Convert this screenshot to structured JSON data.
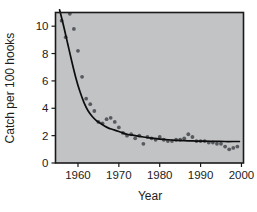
{
  "figure": {
    "background_color": "#ffffff",
    "plot_background_color": "#c2c3c5",
    "frame_color": "#1a1a1a",
    "point_color": "#565a5e",
    "curve_color": "#0d0d0d"
  },
  "axes": {
    "x_title": "Year",
    "y_title": "Catch per 100 hooks",
    "x_ticks": [
      "1960",
      "1970",
      "1980",
      "1990",
      "2000"
    ],
    "y_ticks": [
      "0",
      "2",
      "4",
      "6",
      "8",
      "10"
    ]
  },
  "chart_data": {
    "type": "scatter",
    "title": "",
    "xlabel": "Year",
    "ylabel": "Catch per 100 hooks",
    "xlim": [
      1954.5,
      2000.5
    ],
    "ylim": [
      0,
      11
    ],
    "xticks": [
      1960,
      1970,
      1980,
      1990,
      2000
    ],
    "yticks": [
      0,
      2,
      4,
      6,
      8,
      10
    ],
    "grid": false,
    "legend": "none",
    "series": [
      {
        "name": "Observed catch rate",
        "type": "scatter",
        "marker": "filled-circle",
        "color": "#565a5e",
        "x": [
          1956,
          1957,
          1958,
          1959,
          1960,
          1961,
          1962,
          1963,
          1964,
          1965,
          1966,
          1967,
          1968,
          1969,
          1970,
          1971,
          1972,
          1973,
          1974,
          1975,
          1976,
          1977,
          1978,
          1979,
          1980,
          1981,
          1982,
          1983,
          1984,
          1985,
          1986,
          1987,
          1988,
          1989,
          1990,
          1991,
          1992,
          1993,
          1994,
          1995,
          1996,
          1997,
          1998,
          1999
        ],
        "y": [
          10.4,
          9.2,
          10.9,
          9.8,
          8.2,
          6.3,
          4.7,
          4.3,
          3.8,
          3.0,
          2.9,
          3.2,
          3.3,
          3.0,
          2.6,
          2.2,
          2.0,
          2.1,
          1.8,
          2.0,
          1.4,
          1.9,
          1.8,
          1.7,
          1.9,
          1.7,
          1.6,
          1.6,
          1.7,
          1.7,
          1.8,
          2.1,
          1.9,
          1.6,
          1.6,
          1.6,
          1.5,
          1.5,
          1.4,
          1.4,
          1.2,
          1.0,
          1.1,
          1.2
        ]
      },
      {
        "name": "Fitted decline curve",
        "type": "line",
        "color": "#0d0d0d",
        "x": [
          1955.5,
          1956.5,
          1957.5,
          1958.5,
          1959.5,
          1960.5,
          1961.5,
          1962.5,
          1963.5,
          1964.5,
          1965.5,
          1966.5,
          1967.5,
          1968.5,
          1969.5,
          1970.5,
          1972,
          1974,
          1976,
          1978,
          1980,
          1982,
          1984,
          1986,
          1988,
          1990,
          1992,
          1994,
          1996,
          1998,
          1999.5
        ],
        "y": [
          11.2,
          10.0,
          8.7,
          7.4,
          6.2,
          5.2,
          4.4,
          3.8,
          3.4,
          3.1,
          2.9,
          2.7,
          2.55,
          2.45,
          2.35,
          2.25,
          2.1,
          2.0,
          1.9,
          1.82,
          1.75,
          1.7,
          1.66,
          1.63,
          1.61,
          1.6,
          1.59,
          1.58,
          1.57,
          1.57,
          1.57
        ]
      }
    ]
  }
}
